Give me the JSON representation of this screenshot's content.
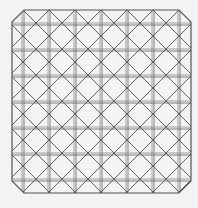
{
  "diagram": {
    "type": "lattice-pattern",
    "canvas": {
      "width": 198,
      "height": 208,
      "background": "#f3f3f3"
    },
    "frame": {
      "left": 12,
      "top": 10,
      "right": 191,
      "bottom": 193,
      "chamfer": 12
    },
    "grid": {
      "vertical_lines_x": [
        23,
        49,
        75,
        101,
        127,
        153,
        179
      ],
      "horizontal_lines_y": [
        24,
        50,
        76,
        102,
        128,
        154,
        180
      ],
      "double_offset": 2
    },
    "diagonals": {
      "sum_constants": [
        33,
        59,
        85,
        111,
        137,
        163,
        189,
        215,
        241,
        267,
        293,
        319,
        345,
        371
      ],
      "diff_constants": [
        -169,
        -143,
        -117,
        -91,
        -65,
        -39,
        -13,
        13,
        39,
        65,
        91,
        117,
        143,
        169
      ]
    },
    "colors": {
      "line": "#5f5f5f",
      "line_light": "#8a8a8a",
      "frame": "#555555"
    }
  }
}
